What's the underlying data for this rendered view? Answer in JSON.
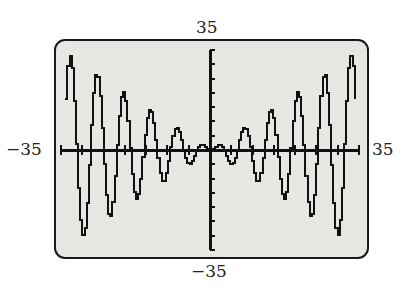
{
  "window": {
    "ymax_label": "35",
    "ymin_label": "−35",
    "xmin_label": "−35",
    "xmax_label": "35"
  },
  "colors": {
    "screen_bg": "#e6e6e3",
    "ink": "#111111",
    "border": "#1a1a1a"
  },
  "chart_data": {
    "type": "line",
    "title": "",
    "xlabel": "",
    "ylabel": "",
    "function_hint": "y = x·sin(x)",
    "xlim": [
      -35,
      35
    ],
    "ylim": [
      -35,
      35
    ],
    "xscl": 5,
    "yscl": 5,
    "grid": false,
    "legend": null,
    "tick_labels": {
      "top": "35",
      "bottom": "-35",
      "left": "-35",
      "right": "35"
    },
    "x": [
      -34,
      -32,
      -30,
      -28,
      -26,
      -24,
      -22,
      -20,
      -18,
      -16,
      -14,
      -12,
      -10,
      -8,
      -6,
      -4,
      -2,
      0,
      2,
      4,
      6,
      8,
      10,
      12,
      14,
      16,
      18,
      20,
      22,
      24,
      26,
      28,
      30,
      32,
      34
    ],
    "values": [
      18.1,
      -17.6,
      -29.6,
      -7.7,
      19.8,
      21.8,
      -0.2,
      -18.3,
      -13.5,
      4.6,
      13.9,
      6.4,
      -5.4,
      -7.9,
      -1.7,
      3.0,
      1.8,
      0,
      1.8,
      3.0,
      -1.7,
      7.9,
      -5.4,
      -6.4,
      13.9,
      -4.6,
      -13.5,
      18.3,
      -0.2,
      -21.8,
      19.8,
      7.7,
      -29.6,
      17.6,
      18.1
    ]
  }
}
